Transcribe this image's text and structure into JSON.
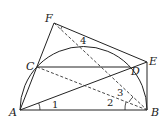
{
  "figure": {
    "type": "geometry-diagram",
    "points": {
      "A": {
        "label": "A",
        "x": 20,
        "y": 110
      },
      "B": {
        "label": "B",
        "x": 147,
        "y": 110
      },
      "C": {
        "label": "C",
        "x": 37,
        "y": 67
      },
      "D": {
        "label": "D",
        "x": 130,
        "y": 67
      },
      "E": {
        "label": "E",
        "x": 147,
        "y": 62
      },
      "F": {
        "label": "F",
        "x": 54,
        "y": 23
      }
    },
    "angle_labels": {
      "a1": "1",
      "a2": "2",
      "a3": "3",
      "a4": "4"
    },
    "segments_solid": [
      "AB",
      "AF",
      "FE",
      "EB",
      "CD",
      "AE"
    ],
    "segments_dashed": [
      "FB",
      "CB"
    ],
    "arc": "semicircle on AB",
    "stroke_color": "#222222"
  }
}
